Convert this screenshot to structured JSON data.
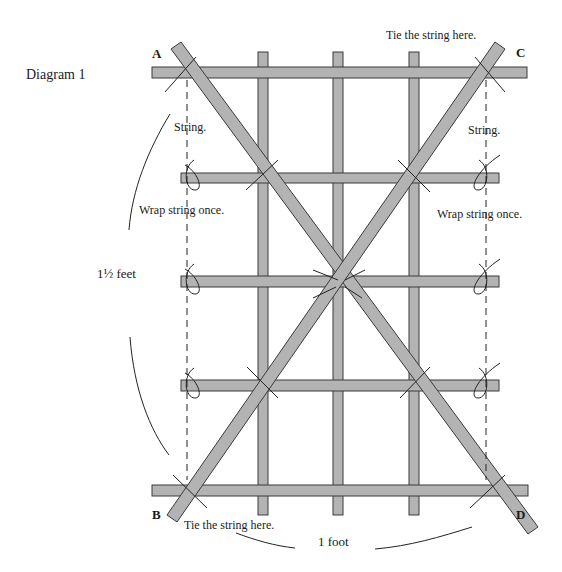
{
  "diagram": {
    "title": "Diagram 1",
    "corners": {
      "a": "A",
      "b": "B",
      "c": "C",
      "d": "D"
    },
    "labels": {
      "tie_top": "Tie the string here.",
      "tie_bottom": "Tie the string here.",
      "string_left": "String.",
      "string_right": "String.",
      "wrap_left": "Wrap string once.",
      "wrap_right": "Wrap string once.",
      "height": "1½ feet",
      "width": "1 foot"
    },
    "colors": {
      "stick_fill": "#b3b3b3",
      "stick_outline": "#3a3a3a",
      "ink": "#1a1a1a"
    }
  }
}
